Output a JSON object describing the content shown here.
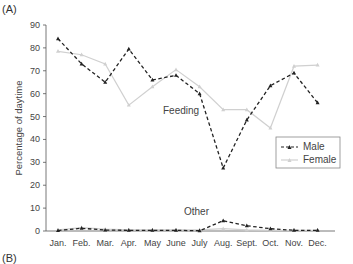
{
  "panel_label": "(A)",
  "next_panel_label": "(B)",
  "colors": {
    "male": "#222222",
    "female": "#d0d0d0",
    "axis": "#555555"
  },
  "chart_data": {
    "type": "line",
    "title": "",
    "xlabel": "",
    "ylabel": "Percentage of daytime",
    "ylim": [
      0,
      90
    ],
    "yticks": [
      0,
      10,
      20,
      30,
      40,
      50,
      60,
      70,
      80,
      90
    ],
    "grid": false,
    "legend_position": "right-middle",
    "categories": [
      "Jan.",
      "Feb.",
      "Mar.",
      "Apr.",
      "May",
      "June",
      "July",
      "Aug.",
      "Sept.",
      "Oct.",
      "Nov.",
      "Dec."
    ],
    "series": [
      {
        "name": "Male",
        "group": "Feeding",
        "style": "dashed-triangle",
        "values": [
          84,
          73,
          65,
          79.5,
          66,
          68,
          60,
          27.5,
          48.5,
          63.5,
          69,
          56
        ]
      },
      {
        "name": "Female",
        "group": "Feeding",
        "style": "solid-light",
        "values": [
          78.5,
          77,
          73,
          55,
          63,
          70.5,
          63,
          53,
          53,
          45,
          72,
          72.5
        ]
      },
      {
        "name": "Male",
        "group": "Other",
        "style": "dashed-triangle",
        "values": [
          0.2,
          1.2,
          0.4,
          0.3,
          0.3,
          0.3,
          0.1,
          4.5,
          2.3,
          1.0,
          0.3,
          0.3
        ]
      },
      {
        "name": "Female",
        "group": "Other",
        "style": "solid-light",
        "values": [
          0.5,
          1.5,
          0.8,
          0.5,
          0.5,
          0.5,
          0.5,
          1.0,
          0.5,
          0.3,
          0.3,
          0.3
        ]
      }
    ],
    "annotations": [
      {
        "text": "Feeding",
        "month": "June",
        "value": 40
      },
      {
        "text": "Other",
        "month": "July",
        "value": 9
      }
    ],
    "legend": [
      "Male",
      "Female"
    ]
  }
}
